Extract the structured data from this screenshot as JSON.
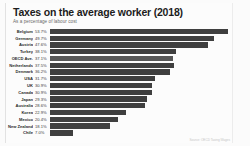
{
  "header": {
    "title": "Taxes on the average worker (2018)",
    "subtitle": "As a percentage of labour cost"
  },
  "footer": {
    "source": "Source: OECD Taxing Wages"
  },
  "chart_data": {
    "type": "bar",
    "orientation": "horizontal",
    "title": "Taxes on the average worker (2018)",
    "subtitle": "As a percentage of labour cost",
    "xlabel": "",
    "ylabel": "",
    "xlim": [
      0,
      55
    ],
    "grid": false,
    "legend": false,
    "unit": "%",
    "bar_color": "#3f3f3f",
    "highlight_color": "#585858",
    "background": "#fcfcfc",
    "categories": [
      "Belgium",
      "Germany",
      "Austria",
      "Turkey",
      "OECD Ave.",
      "Netherlands",
      "Denmark",
      "USA",
      "UK",
      "Canada",
      "Japan",
      "Australia",
      "Korea",
      "Mexico",
      "New Zealand",
      "Chile"
    ],
    "values": [
      53.7,
      49.7,
      47.6,
      38.1,
      37.1,
      37.5,
      36.2,
      31.7,
      30.9,
      30.9,
      29.3,
      28.6,
      22.9,
      20.4,
      18.1,
      7.0
    ],
    "labels": [
      "53.7%",
      "49.7%",
      "47.6%",
      "38.1%",
      "37.1%",
      "37.5%",
      "36.2%",
      "31.7%",
      "30.9%",
      "30.9%",
      "29.3%",
      "28.6%",
      "22.9%",
      "20.4%",
      "18.1%",
      "7.0%"
    ],
    "highlight_index": 4
  }
}
